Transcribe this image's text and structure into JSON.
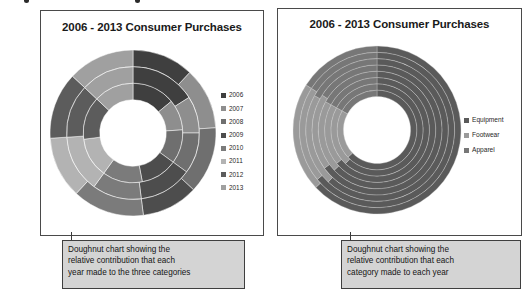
{
  "page": {
    "background": "#ffffff",
    "top_clipped_marks": [
      {
        "x": 24
      },
      {
        "x": 135
      }
    ]
  },
  "panels": [
    {
      "id": "left",
      "title": "2006 - 2013 Consumer Purchases",
      "legend_title": "",
      "legend": [
        {
          "label": "2006",
          "color": "#3f3f3f"
        },
        {
          "label": "2007",
          "color": "#8e8e8e"
        },
        {
          "label": "2008",
          "color": "#6f6f6f"
        },
        {
          "label": "2009",
          "color": "#4d4d4d"
        },
        {
          "label": "2010",
          "color": "#7b7b7b"
        },
        {
          "label": "2011",
          "color": "#b3b3b3"
        },
        {
          "label": "2012",
          "color": "#5c5c5c"
        },
        {
          "label": "2013",
          "color": "#a0a0a0"
        }
      ],
      "caption": "Doughnut chart showing the\nrelative contribution that each\nyear made to the three categories"
    },
    {
      "id": "right",
      "title": "2006 - 2013 Consumer Purchases",
      "legend_title": "",
      "legend": [
        {
          "label": "Equipment",
          "color": "#5a5a5a"
        },
        {
          "label": "Footwear",
          "color": "#9a9a9a"
        },
        {
          "label": "Apparel",
          "color": "#777777"
        }
      ],
      "caption": "Doughnut chart showing the\nrelative contribution that each\ncategory made to each year"
    }
  ],
  "chart_data": [
    {
      "type": "pie",
      "variant": "doughnut-multiring",
      "title": "2006 - 2013 Consumer Purchases",
      "xlabel": "",
      "ylabel": "",
      "legend_position": "right",
      "grid": false,
      "description": "Three concentric rings, one per category; each ring is split into eight year segments showing each year's relative contribution to that category.",
      "rings": [
        "Equipment",
        "Footwear",
        "Apparel"
      ],
      "categories": [
        "2006",
        "2007",
        "2008",
        "2009",
        "2010",
        "2011",
        "2012",
        "2013"
      ],
      "series": [
        {
          "name": "Equipment",
          "values": [
            14,
            10,
            11,
            12,
            13,
            13,
            14,
            13
          ]
        },
        {
          "name": "Footwear",
          "values": [
            16,
            9,
            10,
            13,
            12,
            14,
            13,
            13
          ]
        },
        {
          "name": "Apparel",
          "values": [
            12,
            12,
            13,
            11,
            14,
            12,
            13,
            13
          ]
        }
      ],
      "colors": [
        "#3f3f3f",
        "#8e8e8e",
        "#6f6f6f",
        "#4d4d4d",
        "#7b7b7b",
        "#b3b3b3",
        "#5c5c5c",
        "#a0a0a0"
      ]
    },
    {
      "type": "pie",
      "variant": "doughnut-multiring",
      "title": "2006 - 2013 Consumer Purchases",
      "xlabel": "",
      "ylabel": "",
      "legend_position": "right",
      "grid": false,
      "description": "Eight concentric rings, one per year; each ring is split into three category segments showing each category's relative contribution to that year.",
      "rings": [
        "2006",
        "2007",
        "2008",
        "2009",
        "2010",
        "2011",
        "2012",
        "2013"
      ],
      "categories": [
        "Equipment",
        "Footwear",
        "Apparel"
      ],
      "series": [
        {
          "name": "2006",
          "values": [
            63,
            20,
            17
          ]
        },
        {
          "name": "2007",
          "values": [
            62,
            21,
            17
          ]
        },
        {
          "name": "2008",
          "values": [
            64,
            19,
            17
          ]
        },
        {
          "name": "2009",
          "values": [
            63,
            20,
            17
          ]
        },
        {
          "name": "2010",
          "values": [
            65,
            19,
            16
          ]
        },
        {
          "name": "2011",
          "values": [
            62,
            21,
            17
          ]
        },
        {
          "name": "2012",
          "values": [
            64,
            20,
            16
          ]
        },
        {
          "name": "2013",
          "values": [
            63,
            21,
            16
          ]
        }
      ],
      "colors": [
        "#5a5a5a",
        "#9a9a9a",
        "#777777"
      ]
    }
  ]
}
